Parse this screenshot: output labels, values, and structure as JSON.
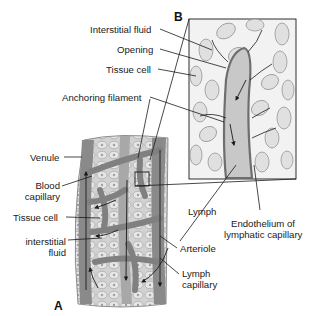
{
  "figure": {
    "panel_a_label": "A",
    "panel_b_label": "B",
    "colors": {
      "background": "#ffffff",
      "vessel": "#8a8a8a",
      "vessel_dark": "#6e6e6e",
      "tissue": "#d6d6d6",
      "cell": "#e4e4e4",
      "lymph": "#c8c8c8",
      "line": "#1a1a1a"
    }
  },
  "labels_b": {
    "interstitial_fluid": "Interstitial fluid",
    "opening": "Opening",
    "tissue_cell": "Tissue cell",
    "anchoring_filament": "Anchoring filament",
    "lymph": "Lymph",
    "endothelium_line1": "Endothelium of",
    "endothelium_line2": "lymphatic capillary"
  },
  "labels_a": {
    "venule": "Venule",
    "blood_capillary_line1": "Blood",
    "blood_capillary_line2": "capillary",
    "tissue_cell": "Tissue cell",
    "interstitial_fluid_line1": "interstitial",
    "interstitial_fluid_line2": "fluid",
    "arteriole": "Arteriole",
    "lymph_capillary_line1": "Lymph",
    "lymph_capillary_line2": "capillary"
  }
}
